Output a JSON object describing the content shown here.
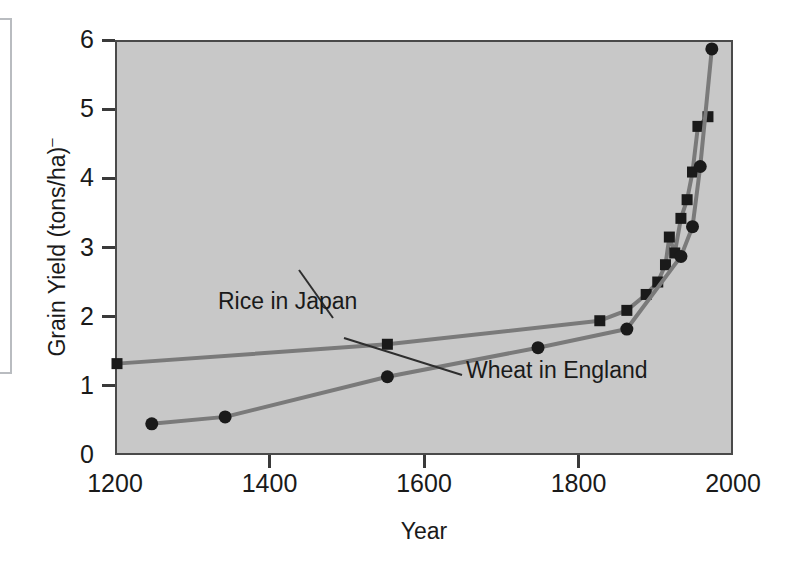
{
  "axes": {
    "x_title": "Year",
    "y_title_main": "Grain Yield (tons/ha)",
    "y_title_sup": "–",
    "x_ticks": [
      "1200",
      "1400",
      "1600",
      "1800",
      "2000"
    ],
    "y_ticks": [
      "0",
      "1",
      "2",
      "3",
      "4",
      "5",
      "6"
    ]
  },
  "annotations": {
    "rice": "Rice in Japan",
    "wheat": "Wheat in England"
  },
  "chart_data": {
    "type": "line",
    "title": "",
    "xlabel": "Year",
    "ylabel": "Grain Yield (tons/ha)",
    "xlim": [
      1200,
      2000
    ],
    "ylim": [
      0,
      6
    ],
    "x_ticks": [
      1200,
      1400,
      1600,
      1800,
      2000
    ],
    "y_ticks": [
      0,
      1,
      2,
      3,
      4,
      5,
      6
    ],
    "grid": false,
    "legend": "inline-annotations",
    "line_color": "#7a7a7a",
    "marker_color": "#1a1a1a",
    "plot_background": "#c8c8c8",
    "series": [
      {
        "name": "Rice in Japan",
        "marker": "square",
        "points": [
          [
            1200,
            1.35
          ],
          [
            1550,
            1.63
          ],
          [
            1825,
            1.97
          ],
          [
            1860,
            2.12
          ],
          [
            1885,
            2.35
          ],
          [
            1900,
            2.53
          ],
          [
            1910,
            2.78
          ],
          [
            1915,
            3.18
          ],
          [
            1922,
            2.95
          ],
          [
            1930,
            3.45
          ],
          [
            1938,
            3.72
          ],
          [
            1945,
            4.12
          ],
          [
            1952,
            4.78
          ],
          [
            1965,
            4.92
          ]
        ]
      },
      {
        "name": "Wheat in England",
        "marker": "circle",
        "points": [
          [
            1245,
            0.48
          ],
          [
            1340,
            0.58
          ],
          [
            1550,
            1.16
          ],
          [
            1745,
            1.58
          ],
          [
            1860,
            1.85
          ],
          [
            1930,
            2.9
          ],
          [
            1945,
            3.33
          ],
          [
            1955,
            4.2
          ],
          [
            1970,
            5.9
          ]
        ]
      }
    ]
  }
}
